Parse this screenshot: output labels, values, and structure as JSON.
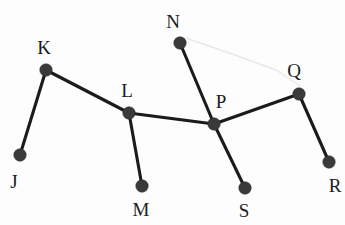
{
  "figure": {
    "width": 345,
    "height": 225,
    "background_color": "#fdfdfd",
    "edge_color": "#1b1b1b",
    "vertex_color": "#3a3a3a",
    "label_color": "#1c1c1c",
    "artifact_color": "#e9e9ea",
    "vertex_radius": 6.2,
    "edge_width": 3.1
  },
  "graph_data": {
    "type": "node-link-diagram",
    "directed": false,
    "vertex_count": 9,
    "edge_count": 8,
    "vertices": [
      {
        "id": "J",
        "label": "J",
        "x": 20,
        "y": 155,
        "label_x": 14,
        "label_y": 181,
        "degree": 1
      },
      {
        "id": "K",
        "label": "K",
        "x": 46,
        "y": 70,
        "label_x": 44,
        "label_y": 47,
        "degree": 2
      },
      {
        "id": "L",
        "label": "L",
        "x": 129,
        "y": 113,
        "label_x": 127,
        "label_y": 90,
        "degree": 3
      },
      {
        "id": "M",
        "label": "M",
        "x": 142,
        "y": 186,
        "label_x": 141,
        "label_y": 209,
        "degree": 1
      },
      {
        "id": "N",
        "label": "N",
        "x": 180,
        "y": 43,
        "label_x": 173,
        "label_y": 21,
        "degree": 1
      },
      {
        "id": "P",
        "label": "P",
        "x": 214,
        "y": 124,
        "label_x": 221,
        "label_y": 101,
        "degree": 4
      },
      {
        "id": "Q",
        "label": "Q",
        "x": 299,
        "y": 94,
        "label_x": 294,
        "label_y": 70,
        "degree": 2
      },
      {
        "id": "R",
        "label": "R",
        "x": 329,
        "y": 162,
        "label_x": 335,
        "label_y": 185,
        "degree": 1
      },
      {
        "id": "S",
        "label": "S",
        "x": 245,
        "y": 188,
        "label_x": 244,
        "label_y": 210,
        "degree": 1
      }
    ],
    "edges": [
      {
        "id": "J-K",
        "source": "J",
        "target": "K"
      },
      {
        "id": "K-L",
        "source": "K",
        "target": "L"
      },
      {
        "id": "L-M",
        "source": "L",
        "target": "M"
      },
      {
        "id": "L-P",
        "source": "L",
        "target": "P"
      },
      {
        "id": "N-P",
        "source": "N",
        "target": "P"
      },
      {
        "id": "P-S",
        "source": "P",
        "target": "S"
      },
      {
        "id": "P-Q",
        "source": "P",
        "target": "Q"
      },
      {
        "id": "Q-R",
        "source": "Q",
        "target": "R"
      }
    ],
    "artifacts": [
      {
        "id": "faint-scan-line",
        "points": "186,38 232,54 276,70 300,86"
      }
    ]
  }
}
